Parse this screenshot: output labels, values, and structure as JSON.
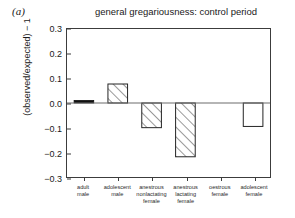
{
  "panel": {
    "label": "(a)"
  },
  "axis": {
    "ylabel": "(observed/expected) − 1",
    "xlabel": "",
    "yticks": [
      "0.3",
      "0.2",
      "0.1",
      "0.0",
      "−0.1",
      "−0.2",
      "−0.3"
    ]
  },
  "colors": {
    "bar_outline": "#222222",
    "bar_fill": "#ffffff",
    "hatch": "#333333",
    "solid_bar": "#111111",
    "axis": "#3c3c3c",
    "background": "#ffffff"
  },
  "chart_data": {
    "type": "bar",
    "title": "general gregariousness: control period",
    "xlabel": "",
    "ylabel": "(observed/expected) − 1",
    "ylim": [
      -0.3,
      0.3
    ],
    "yticks": [
      0.3,
      0.2,
      0.1,
      0.0,
      -0.1,
      -0.2,
      -0.3
    ],
    "grid": false,
    "legend": "none",
    "categories": [
      "adult male",
      "adolescent male",
      "anestrous nonlactating female",
      "anestrous lactating female",
      "oestrous female",
      "adolescent female"
    ],
    "category_lines": [
      [
        "adult",
        "male"
      ],
      [
        "adolescent",
        "male"
      ],
      [
        "anestrous",
        "nonlactating",
        "female"
      ],
      [
        "anestrous",
        "lactating",
        "female"
      ],
      [
        "oestrous",
        "female"
      ],
      [
        "adolescent",
        "female"
      ]
    ],
    "values": [
      0.005,
      0.077,
      -0.1,
      -0.218,
      0.0,
      -0.095
    ],
    "bar_styles": [
      "solid",
      "hatched",
      "hatched",
      "hatched",
      "none",
      "open"
    ]
  }
}
